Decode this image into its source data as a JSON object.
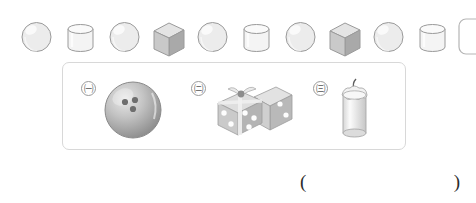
{
  "pattern_row": {
    "name": "shape-pattern-sequence",
    "unit": [
      "sphere",
      "cylinder",
      "sphere",
      "cube"
    ],
    "items": [
      {
        "shape": "sphere",
        "filled": true
      },
      {
        "shape": "cylinder",
        "filled": true
      },
      {
        "shape": "sphere",
        "filled": true
      },
      {
        "shape": "cube",
        "filled": true
      },
      {
        "shape": "sphere",
        "filled": true
      },
      {
        "shape": "cylinder",
        "filled": true
      },
      {
        "shape": "sphere",
        "filled": true
      },
      {
        "shape": "cube",
        "filled": true
      },
      {
        "shape": "sphere",
        "filled": true
      },
      {
        "shape": "cylinder",
        "filled": true
      },
      {
        "shape": "blank",
        "filled": false
      }
    ]
  },
  "options": {
    "panel_name": "answer-options-panel",
    "items": [
      {
        "label": "㈠",
        "object": "bowling-ball",
        "shape": "sphere"
      },
      {
        "label": "㈡",
        "object": "dice-pair",
        "shape": "cube"
      },
      {
        "label": "㈢",
        "object": "candle",
        "shape": "cylinder"
      }
    ]
  },
  "answer": {
    "open_paren": "(",
    "close_paren": ")",
    "value": ""
  },
  "colors": {
    "shape_outline": "#9a9a9a",
    "sphere_fill": "#ececec",
    "cylinder_fill": "#f4f4f4",
    "cube_front": "#c9c9c9",
    "cube_top": "#e4e4e4",
    "cube_side": "#a9a9a9",
    "panel_border": "#d8d8d8",
    "blank_border": "#b5b5b5"
  }
}
